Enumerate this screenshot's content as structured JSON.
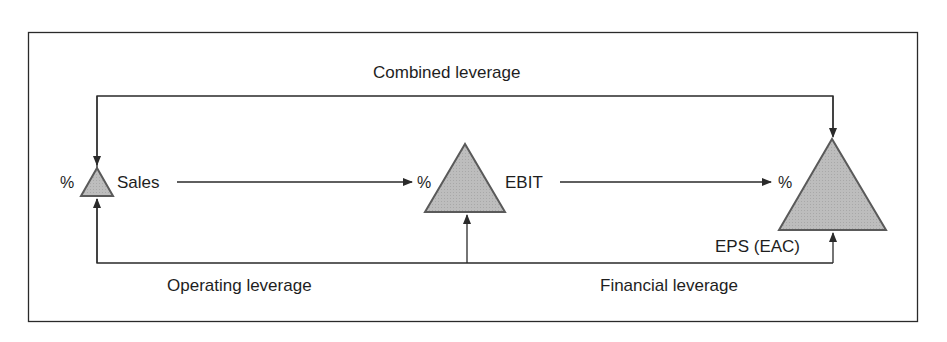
{
  "diagram": {
    "title": "Combined leverage",
    "nodes": [
      {
        "id": "sales",
        "prefix": "%",
        "label": "Sales",
        "size": "small"
      },
      {
        "id": "ebit",
        "prefix": "%",
        "label": "EBIT",
        "size": "medium"
      },
      {
        "id": "eps",
        "prefix": "%",
        "label": "EPS (EAC)",
        "size": "large"
      }
    ],
    "edges": [
      {
        "from": "sales",
        "to": "ebit",
        "label": ""
      },
      {
        "from": "ebit",
        "to": "eps",
        "label": ""
      },
      {
        "from": "sales",
        "to": "eps",
        "label": "Combined leverage",
        "route": "top"
      },
      {
        "from": "sales",
        "to": "ebit",
        "label": "Operating leverage",
        "route": "bottom"
      },
      {
        "from": "ebit",
        "to": "eps",
        "label": "Financial leverage",
        "route": "bottom"
      }
    ],
    "labels": {
      "combined": "Combined leverage",
      "operating": "Operating leverage",
      "financial": "Financial leverage"
    },
    "colors": {
      "triangle_fill": "#b9b9b9",
      "triangle_stroke": "#5a5a5a",
      "line": "#2a2a2a",
      "text": "#1e1e1e"
    }
  }
}
